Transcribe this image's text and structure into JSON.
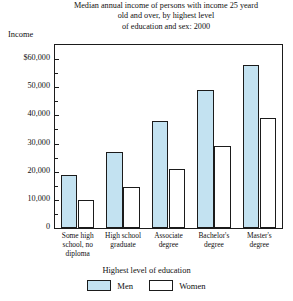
{
  "chart_data": {
    "type": "bar",
    "title": "Median annual income of persons with income 25 yeard old and over, by highest level of education and sex: 2000",
    "title_lines": [
      "Median annual income of persons with income 25 yeard",
      "old and over, by highest level",
      "of education and sex: 2000"
    ],
    "xlabel": "Highest level of education",
    "ylabel": "Income",
    "ylim": [
      0,
      65000
    ],
    "grid": false,
    "legend_position": "bottom",
    "categories": [
      "Some high school, no diploma",
      "High school graduate",
      "Associate degree",
      "Bachelor's degree",
      "Master's degree"
    ],
    "category_lines": [
      [
        "Some high",
        "school, no",
        "diploma"
      ],
      [
        "High school",
        "graduate"
      ],
      [
        "Associate",
        "degree"
      ],
      [
        "Bachelor's",
        "degree"
      ],
      [
        "Master's",
        "degree"
      ]
    ],
    "series": [
      {
        "name": "Men",
        "color": "#c3e2f1",
        "values": [
          19000,
          27000,
          38000,
          49000,
          58000
        ]
      },
      {
        "name": "Women",
        "color": "#ffffff",
        "values": [
          10000,
          14500,
          21000,
          29000,
          39000
        ]
      }
    ],
    "y_ticks": [
      {
        "value": 60000,
        "label": "$60,000"
      },
      {
        "value": 50000,
        "label": "50,000"
      },
      {
        "value": 40000,
        "label": "40,000"
      },
      {
        "value": 30000,
        "label": "30,000"
      },
      {
        "value": 20000,
        "label": "20,000"
      },
      {
        "value": 10000,
        "label": "10,000"
      },
      {
        "value": 0,
        "label": "0"
      }
    ],
    "y_minor_ticks": [
      55000,
      45000,
      35000,
      25000,
      15000,
      5000
    ]
  },
  "legend": {
    "items": [
      {
        "label": "Men"
      },
      {
        "label": "Women"
      }
    ]
  }
}
